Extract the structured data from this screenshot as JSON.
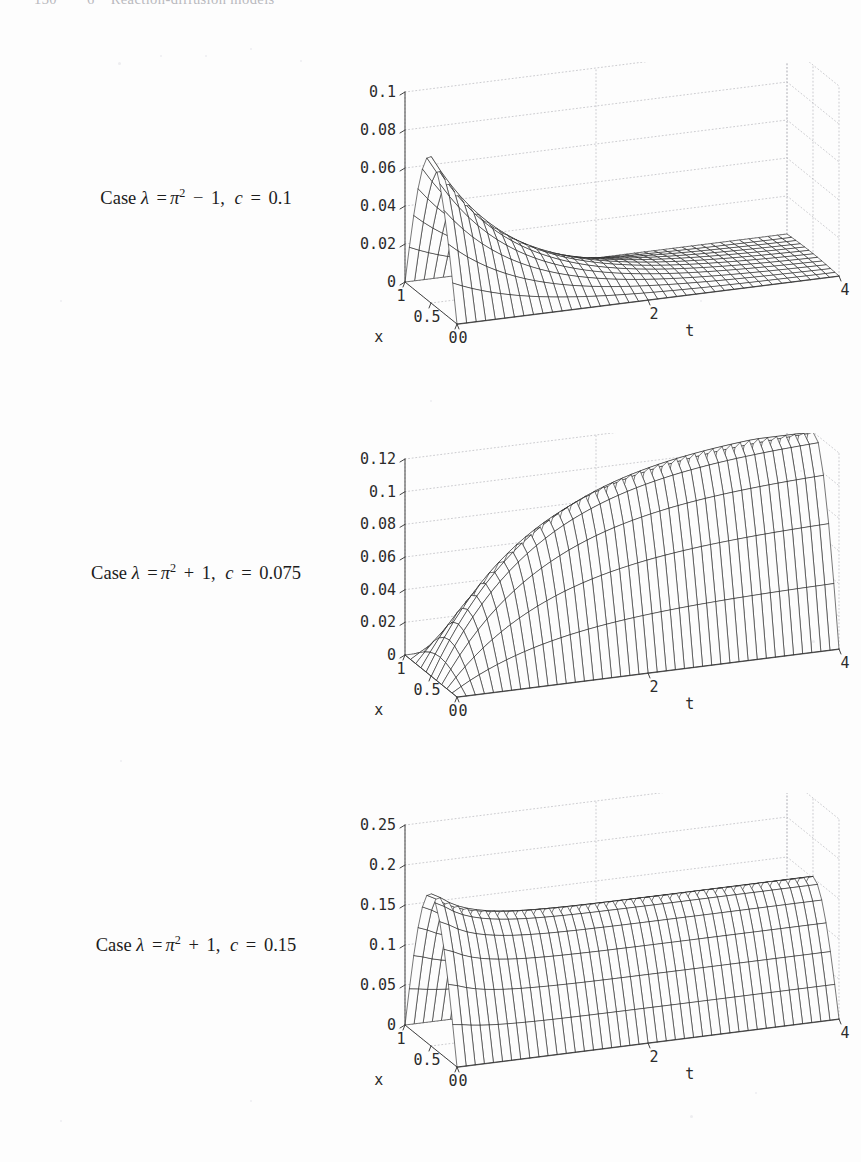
{
  "page": {
    "running_head": {
      "folio": "130",
      "chapter_number": "6",
      "chapter_title": "Reaction-diffusion models"
    },
    "width": 861,
    "height": 1162,
    "background": "#fdfdfd",
    "ink": "#1c1c1c"
  },
  "figures": [
    {
      "id": "figure-case-1",
      "caption": {
        "prefix": "Case",
        "lambda_symbol": "λ",
        "equals": "=",
        "pi_symbol": "π",
        "exponent": "2",
        "operator": "−",
        "operand": "1",
        "c_symbol": "c",
        "c_value": "0.1",
        "plain": "Case λ = π² − 1, c = 0.1"
      },
      "chart_data": {
        "type": "surface",
        "title": "Case λ = π² − 1, c = 0.1",
        "xlabel": "x",
        "ylabel": "t",
        "zlabel": "",
        "xticks": [
          "1",
          "0.5",
          "0"
        ],
        "xtickvals": [
          1,
          0.5,
          0
        ],
        "yticks": [
          "0",
          "2",
          "4"
        ],
        "ytickvals": [
          0,
          2,
          4
        ],
        "zticks": [
          "0",
          "0.02",
          "0.04",
          "0.06",
          "0.08",
          "0.1"
        ],
        "ztickvals": [
          0,
          0.02,
          0.04,
          0.06,
          0.08,
          0.1
        ],
        "xlim": [
          0,
          1
        ],
        "ylim": [
          0,
          4
        ],
        "zlim": [
          0,
          0.1
        ],
        "grid": true,
        "legend": "none",
        "peak_value": 0.077,
        "peak_at": {
          "x": 0.5,
          "t": 0
        },
        "final_value": 0.0,
        "behaviour": "decays to zero",
        "lambda": "pi^2 - 1",
        "c": 0.1
      }
    },
    {
      "id": "figure-case-2",
      "caption": {
        "prefix": "Case",
        "lambda_symbol": "λ",
        "equals": "=",
        "pi_symbol": "π",
        "exponent": "2",
        "operator": "+",
        "operand": "1",
        "c_symbol": "c",
        "c_value": "0.075",
        "plain": "Case λ = π² + 1, c = 0.075"
      },
      "chart_data": {
        "type": "surface",
        "title": "Case λ = π² + 1, c = 0.075",
        "xlabel": "x",
        "ylabel": "t",
        "zlabel": "",
        "xticks": [
          "1",
          "0.5",
          "0"
        ],
        "xtickvals": [
          1,
          0.5,
          0
        ],
        "yticks": [
          "0",
          "2",
          "4"
        ],
        "ytickvals": [
          0,
          2,
          4
        ],
        "zticks": [
          "0",
          "0.02",
          "0.04",
          "0.06",
          "0.08",
          "0.1",
          "0.12"
        ],
        "ztickvals": [
          0,
          0.02,
          0.04,
          0.06,
          0.08,
          0.1,
          0.12
        ],
        "xlim": [
          0,
          1
        ],
        "ylim": [
          0,
          4
        ],
        "zlim": [
          0,
          0.12
        ],
        "grid": true,
        "legend": "none",
        "peak_value": 0.125,
        "peak_at": {
          "x": 0.5,
          "t": 4
        },
        "final_value": 0.125,
        "behaviour": "grows monotonically to a plateau",
        "lambda": "pi^2 + 1",
        "c": 0.075
      }
    },
    {
      "id": "figure-case-3",
      "caption": {
        "prefix": "Case",
        "lambda_symbol": "λ",
        "equals": "=",
        "pi_symbol": "π",
        "exponent": "2",
        "operator": "+",
        "operand": "1",
        "c_symbol": "c",
        "c_value": "0.15",
        "plain": "Case λ = π² + 1, c = 0.15"
      },
      "chart_data": {
        "type": "surface",
        "title": "Case λ = π² + 1, c = 0.15",
        "xlabel": "x",
        "ylabel": "t",
        "zlabel": "",
        "xticks": [
          "1",
          "0.5",
          "0"
        ],
        "xtickvals": [
          1,
          0.5,
          0
        ],
        "yticks": [
          "0",
          "2",
          "4"
        ],
        "ytickvals": [
          0,
          2,
          4
        ],
        "zticks": [
          "0",
          "0.05",
          "0.1",
          "0.15",
          "0.2",
          "0.25"
        ],
        "ztickvals": [
          0,
          0.05,
          0.1,
          0.15,
          0.2,
          0.25
        ],
        "xlim": [
          0,
          1
        ],
        "ylim": [
          0,
          4
        ],
        "zlim": [
          0,
          0.25
        ],
        "grid": true,
        "legend": "none",
        "peak_value": 0.19,
        "peak_at": {
          "x": 0.5,
          "t": 0
        },
        "final_value": 0.152,
        "behaviour": "initial peak decays then settles to a steady plateau",
        "lambda": "pi^2 + 1",
        "c": 0.15
      }
    }
  ]
}
